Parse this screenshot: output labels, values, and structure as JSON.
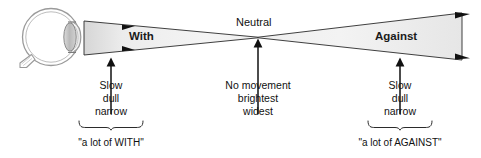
{
  "figure": {
    "title_visible": false,
    "background": "#ffffff",
    "wedge_fill_light": "#f2f2f2",
    "wedge_fill_dark": "#d8d8d8",
    "stroke": "#1c1c1c",
    "eye_outline": "#8e8e8e",
    "lens_fill": "#c9c9c9"
  },
  "eye": {
    "name": "eye-diagram",
    "parts": [
      "globe",
      "cornea",
      "lens",
      "optic-nerve"
    ]
  },
  "wedges": [
    {
      "id": "with",
      "label": "With",
      "direction": "right",
      "shape": "narrowing"
    },
    {
      "id": "against",
      "label": "Against",
      "direction": "right",
      "shape": "widening"
    }
  ],
  "neutral": {
    "label": "Neutral"
  },
  "callouts": [
    {
      "id": "with-callout",
      "lines": [
        "Slow",
        "dull",
        "narrow"
      ],
      "bracket_label": "\"a lot of WITH\"",
      "has_arrow": true,
      "has_bracket": true
    },
    {
      "id": "neutral-callout",
      "lines": [
        "No movement",
        "brightest",
        "widest"
      ],
      "bracket_label": "",
      "has_arrow": true,
      "has_bracket": false
    },
    {
      "id": "against-callout",
      "lines": [
        "Slow",
        "dull",
        "narrow"
      ],
      "bracket_label": "\"a lot of AGAINST\"",
      "has_arrow": true,
      "has_bracket": true
    }
  ]
}
